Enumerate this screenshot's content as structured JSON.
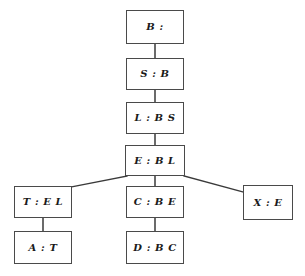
{
  "diagram": {
    "type": "dependency-graph",
    "label_separator": " : ",
    "font_style": "italic-serif-bold",
    "colors": {
      "background": "#ffffff",
      "node_border": "#4a4a4a",
      "node_fill": "#ffffff",
      "edge": "#3a3a3a",
      "text": "#1a1a1a"
    },
    "nodes": [
      {
        "id": "B",
        "label": "B :",
        "name": "B",
        "deps": "",
        "x": 126,
        "y": 10,
        "w": 58,
        "h": 34
      },
      {
        "id": "S",
        "label": "S : B",
        "name": "S",
        "deps": "B",
        "x": 126,
        "y": 58,
        "w": 58,
        "h": 32
      },
      {
        "id": "L",
        "label": "L : B S",
        "name": "L",
        "deps": "B S",
        "x": 126,
        "y": 102,
        "w": 58,
        "h": 32
      },
      {
        "id": "E",
        "label": "E : B L",
        "name": "E",
        "deps": "B L",
        "x": 125,
        "y": 145,
        "w": 60,
        "h": 31
      },
      {
        "id": "T",
        "label": "T : E L",
        "name": "T",
        "deps": "E L",
        "x": 14,
        "y": 186,
        "w": 58,
        "h": 32
      },
      {
        "id": "C",
        "label": "C : B E",
        "name": "C",
        "deps": "B E",
        "x": 126,
        "y": 186,
        "w": 58,
        "h": 32
      },
      {
        "id": "X",
        "label": "X : E",
        "name": "X",
        "deps": "E",
        "x": 243,
        "y": 185,
        "w": 50,
        "h": 35
      },
      {
        "id": "A",
        "label": "A : T",
        "name": "A",
        "deps": "T",
        "x": 14,
        "y": 231,
        "w": 58,
        "h": 33
      },
      {
        "id": "D",
        "label": "D : B C",
        "name": "D",
        "deps": "B C",
        "x": 126,
        "y": 231,
        "w": 58,
        "h": 33
      }
    ],
    "edges": [
      {
        "from": "B",
        "to": "S",
        "kind": "vertical",
        "x1": 155,
        "y1": 44,
        "x2": 155,
        "y2": 58
      },
      {
        "from": "S",
        "to": "L",
        "kind": "vertical",
        "x1": 155,
        "y1": 90,
        "x2": 155,
        "y2": 102
      },
      {
        "from": "L",
        "to": "E",
        "kind": "vertical",
        "x1": 155,
        "y1": 134,
        "x2": 155,
        "y2": 145
      },
      {
        "from": "E",
        "to": "T",
        "kind": "diagonal",
        "x1": 127,
        "y1": 176,
        "x2": 71,
        "y2": 187
      },
      {
        "from": "E",
        "to": "C",
        "kind": "vertical",
        "x1": 155,
        "y1": 176,
        "x2": 155,
        "y2": 186
      },
      {
        "from": "E",
        "to": "X",
        "kind": "diagonal",
        "x1": 184,
        "y1": 176,
        "x2": 243,
        "y2": 192
      },
      {
        "from": "T",
        "to": "A",
        "kind": "vertical",
        "x1": 43,
        "y1": 218,
        "x2": 43,
        "y2": 231
      },
      {
        "from": "C",
        "to": "D",
        "kind": "vertical",
        "x1": 155,
        "y1": 218,
        "x2": 155,
        "y2": 231
      }
    ]
  }
}
